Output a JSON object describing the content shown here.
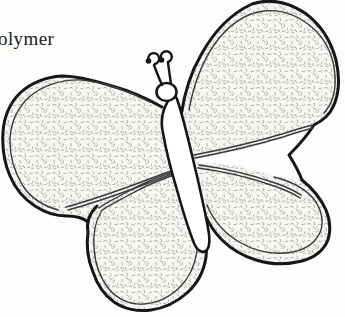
{
  "page": {
    "background": "#fdfdfc"
  },
  "caption": {
    "text": "olymer"
  },
  "illustration": {
    "name": "butterfly-line-drawing",
    "ink_color": "#161616",
    "fine_line_color": "#3a3a3a",
    "stipple_color": "#a3a3a3",
    "wing_fill": "#f7f7f4",
    "body_fill": "#ffffff",
    "parts": [
      "upper-left-wing",
      "upper-right-wing",
      "lower-left-wing",
      "lower-right-wing",
      "body",
      "head",
      "left-antenna",
      "right-antenna"
    ]
  }
}
